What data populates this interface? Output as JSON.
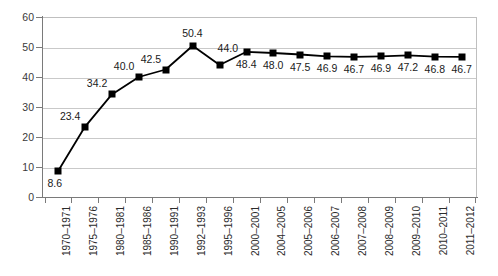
{
  "chart_data": {
    "type": "line",
    "title": "",
    "subtitle": "",
    "xlabel": "",
    "ylabel": "",
    "ylim": [
      0,
      60
    ],
    "y_ticks": [
      0,
      10,
      20,
      30,
      40,
      50,
      60
    ],
    "grid": true,
    "legend": "none",
    "marker": "square",
    "line_color": "#000000",
    "marker_color": "#000000",
    "grid_color": "#c9c9c9",
    "axis_color": "#7a7a7a",
    "categories": [
      "1970–1971",
      "1975–1976",
      "1980–1981",
      "1985–1986",
      "1990–1991",
      "1992–1993",
      "1995–1996",
      "2000–2001",
      "2004–2005",
      "2005–2006",
      "2006–2007",
      "2007–2008",
      "2008–2009",
      "2009–2010",
      "2010–2011",
      "2011–2012"
    ],
    "values": [
      8.6,
      23.4,
      34.2,
      40.0,
      42.5,
      50.4,
      44.0,
      48.4,
      48.0,
      47.5,
      46.9,
      46.7,
      46.9,
      47.2,
      46.8,
      46.7
    ],
    "point_labels": [
      "8.6",
      "23.4",
      "34.2",
      "40.0",
      "42.5",
      "50.4",
      "44.0",
      "48.4",
      "48.0",
      "47.5",
      "46.9",
      "46.7",
      "46.9",
      "47.2",
      "46.8",
      "46.7"
    ],
    "label_positions": [
      "below",
      "above-left",
      "above-left",
      "above-left",
      "above-left",
      "above",
      "above-right",
      "below",
      "below",
      "below",
      "below",
      "below",
      "below",
      "below",
      "below",
      "below"
    ]
  }
}
